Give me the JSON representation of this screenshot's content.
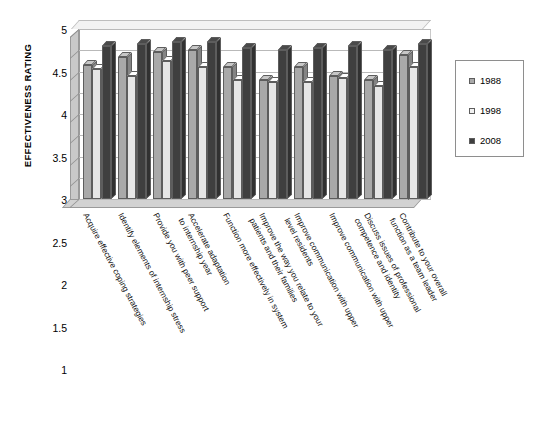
{
  "chart_data": {
    "type": "bar",
    "title": "",
    "xlabel": "",
    "ylabel": "EFFECTIVENESS RATING",
    "ylim": [
      1,
      5
    ],
    "ytick_step": 0.5,
    "yticks": [
      "5",
      "4.5",
      "4",
      "3.5",
      "3",
      "2.5",
      "2",
      "1.5",
      "1"
    ],
    "grid": true,
    "legend_position": "right",
    "categories": [
      "Acquire effective coping strategies",
      "Identify elements of internship stress",
      "Provide you with peer support",
      "Accelerate adaptation\nto internship year",
      "Function more effectively in system",
      "Improve the way you relate to your\npatients and their families",
      "Improve communication with upper\nlevel residents",
      "Improve communication with upper",
      "Discuss issues of professional\ncompetence and identity",
      "Contribute to your overall\nfunction as a team leader"
    ],
    "categories_display": [
      "Acquire effective coping strategies",
      "Identify elements of internship stress",
      "Provide you with peer support",
      "Accelerate adaptation\nto internship year",
      "Function more effectively in system",
      "Improve the way you relate to your\npatients and their families",
      "Improve communication with upper\nlevel residents",
      "Improve communication with upper",
      "Discuss issues of professional\ncompetence and identity",
      "Contribute to your overall\nfunction as a team leader"
    ],
    "series": [
      {
        "name": "1988",
        "color": "#a9a9a9",
        "values": [
          4.15,
          4.35,
          4.45,
          4.5,
          4.1,
          3.8,
          4.1,
          3.9,
          3.8,
          4.4
        ]
      },
      {
        "name": "1998",
        "color": "#e6e6e6",
        "values": [
          4.05,
          3.9,
          4.25,
          4.1,
          3.8,
          3.75,
          3.75,
          3.85,
          3.65,
          4.1
        ]
      },
      {
        "name": "2008",
        "color": "#3f3f3f",
        "values": [
          4.6,
          4.65,
          4.7,
          4.7,
          4.55,
          4.5,
          4.55,
          4.6,
          4.5,
          4.65
        ]
      }
    ]
  },
  "legend": {
    "items": [
      {
        "label": "1988",
        "color": "#a9a9a9"
      },
      {
        "label": "1998",
        "color": "#f2f2f2"
      },
      {
        "label": "2008",
        "color": "#3f3f3f"
      }
    ]
  }
}
